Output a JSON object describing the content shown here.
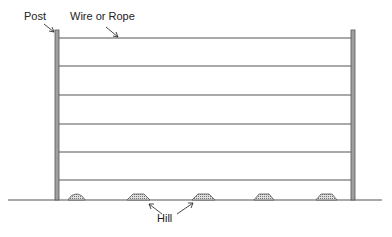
{
  "diagram": {
    "labels": {
      "post": "Post",
      "wire": "Wire or Rope",
      "hill": "Hill"
    },
    "colors": {
      "line": "#555555",
      "post_fill": "#9a9a9a",
      "text": "#222222",
      "hill_fill": "#bdbdbd"
    },
    "wire_count": 6,
    "hill_count": 5
  }
}
